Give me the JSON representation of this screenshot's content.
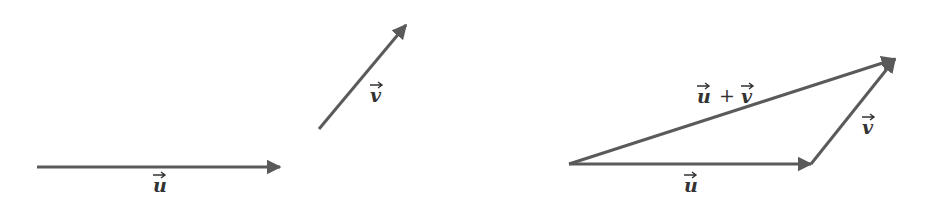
{
  "figure": {
    "colors": {
      "arrow": "#5a5a5a",
      "text": "#333333",
      "background": "#ffffff"
    },
    "left_panel": {
      "description": "Two separate vectors",
      "vectors": [
        {
          "name": "u",
          "label": "u",
          "from": [
            37,
            167
          ],
          "to": [
            280,
            167
          ]
        },
        {
          "name": "v",
          "label": "v",
          "from": [
            319,
            129
          ],
          "to": [
            406,
            25
          ]
        }
      ]
    },
    "right_panel": {
      "description": "Triangle rule for vector addition",
      "vectors": [
        {
          "name": "u",
          "label": "u",
          "from": [
            569,
            164
          ],
          "to": [
            811,
            164
          ]
        },
        {
          "name": "v",
          "label": "v",
          "from": [
            811,
            164
          ],
          "to": [
            895,
            59
          ]
        },
        {
          "name": "u_plus_v",
          "label_left": "u",
          "operator": "+",
          "label_right": "v",
          "from": [
            569,
            164
          ],
          "to": [
            895,
            59
          ]
        }
      ]
    },
    "arrow_symbol": "→"
  }
}
